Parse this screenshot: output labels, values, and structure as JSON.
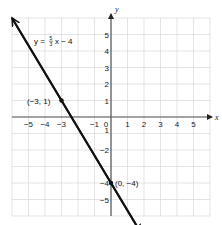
{
  "chart_data": {
    "type": "line",
    "title": "",
    "xlabel": "x",
    "ylabel": "y",
    "xlim": [
      -6,
      6
    ],
    "ylim": [
      -6,
      6
    ],
    "grid": true,
    "x_ticks": [
      -5,
      -4,
      -3,
      -1,
      0,
      1,
      2,
      3,
      4,
      5
    ],
    "x_tick_labels": [
      "−5",
      "−4",
      "−3",
      "−1",
      "0",
      "1",
      "2",
      "3",
      "4",
      "5"
    ],
    "y_ticks": [
      5,
      4,
      3,
      2,
      1,
      -1,
      -2,
      -4,
      -5
    ],
    "y_tick_labels": [
      "5",
      "4",
      "3",
      "2",
      "1",
      "1",
      "−2",
      "−4",
      "−5"
    ],
    "series": [
      {
        "name": "y = −5/3 x − 4",
        "equation": "y = -5/3 x - 4",
        "slope": -1.6667,
        "intercept": -4,
        "x": [
          -6,
          1.8
        ],
        "y": [
          6,
          -7
        ],
        "arrows": "both"
      }
    ],
    "points": [
      {
        "x": -3,
        "y": 1,
        "label": "(−3, 1)"
      },
      {
        "x": 0,
        "y": -4,
        "label": "(0, −4)"
      }
    ],
    "annotations": [
      {
        "text": "y = −5/3 x − 4",
        "position": "upper-left near line"
      }
    ]
  },
  "labels": {
    "equation_prefix": "y = ",
    "equation_num": "5",
    "equation_den": "3",
    "equation_suffix": "x − 4",
    "point_a": "(−3, 1)",
    "point_b": "(0, −4)",
    "x_axis": "x",
    "y_axis": "y"
  },
  "colors": {
    "grid": "#d9d9d9",
    "axis": "#555555",
    "line": "#111111"
  }
}
